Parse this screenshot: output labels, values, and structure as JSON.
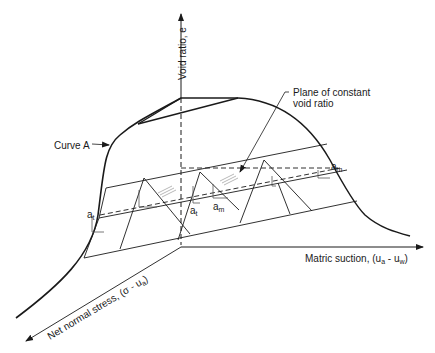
{
  "figure": {
    "type": "3D constitutive surface diagram",
    "axes": {
      "vertical": {
        "label": "Void ratio, e"
      },
      "horizontal": {
        "label": "Matric suction, (u",
        "sub1": "a",
        "mid": " - u",
        "sub2": "w",
        "end": ")"
      },
      "diagonal": {
        "label": "Net normal stress, (σ - u",
        "sub": "a",
        "end": ")"
      }
    },
    "annotations": {
      "curve": "Curve A",
      "plane_line1": "Plane of constant",
      "plane_line2": "void ratio",
      "a_t": {
        "base": "a",
        "sub": "t"
      },
      "a_m": {
        "base": "a",
        "sub": "m"
      }
    },
    "colors": {
      "line": "#1a1a1a",
      "background": "#ffffff"
    }
  }
}
